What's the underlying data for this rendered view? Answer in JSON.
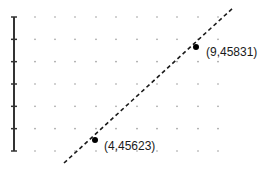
{
  "chart_data": {
    "type": "line",
    "title": "",
    "xlabel": "",
    "ylabel": "",
    "grid": "dotted",
    "legend": null,
    "series": [
      {
        "name": "linear-fit",
        "style": "dashed",
        "points": [
          {
            "x": 4,
            "y": 45623,
            "label": "(4,45623)"
          },
          {
            "x": 9,
            "y": 45831,
            "label": "(9,45831)"
          }
        ],
        "slope": 41.6
      }
    ],
    "y_axis": {
      "tick_count": 7,
      "tick_labels": []
    },
    "colors": {
      "line": "#1a1a1a",
      "points": "#000000",
      "grid": "#9a9a9a",
      "axis": "#333333"
    }
  },
  "labels": {
    "point_a": "(4,45623)",
    "point_b": "(9,45831)"
  }
}
